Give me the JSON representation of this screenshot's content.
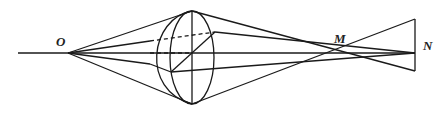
{
  "diagram": {
    "type": "optics-ray-diagram",
    "labels": {
      "O": "O",
      "M": "M",
      "N": "N"
    },
    "stroke_color": "#1a1a1a",
    "background": "#ffffff"
  }
}
